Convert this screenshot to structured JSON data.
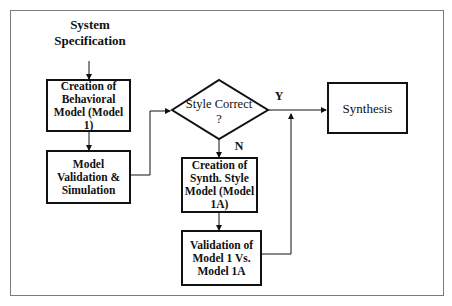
{
  "diagram": {
    "title_line1": "System",
    "title_line2": "Specification",
    "nodes": {
      "behavioral_model": "Creation of Behavioral Model (Model 1)",
      "model_validation": "Model Validation & Simulation",
      "decision": "Style Correct ?",
      "synthesis": "Synthesis",
      "synth_style_model": "Creation of Synth. Style Model (Model 1A)",
      "validation_1_vs_1a": "Validation of Model 1 Vs. Model 1A"
    },
    "edge_labels": {
      "yes": "Y",
      "no": "N"
    }
  }
}
